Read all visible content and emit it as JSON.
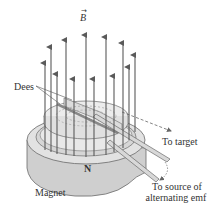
{
  "figure": {
    "labels": {
      "field": "B",
      "field_vector_mark": "→",
      "dees": "Dees",
      "pole": "N",
      "magnet": "Magnet",
      "to_target": "To target",
      "source_line1": "To source of",
      "source_line2": "alternating emf"
    },
    "colors": {
      "arrow": "#5a5a5a",
      "magnet_fill": "#cfcfcf",
      "magnet_top": "#e2e2e2",
      "dee_fill": "#ececec",
      "outline": "#6a6a6a",
      "text": "#333333"
    },
    "field_arrow_count": 12
  }
}
